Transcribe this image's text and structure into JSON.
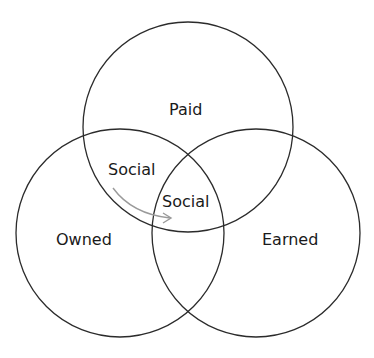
{
  "diagram": {
    "type": "venn",
    "circles": [
      {
        "id": "paid",
        "label": "Paid",
        "cx": 188,
        "cy": 127,
        "r": 105
      },
      {
        "id": "owned",
        "label": "Owned",
        "cx": 120,
        "cy": 233,
        "r": 104
      },
      {
        "id": "earned",
        "label": "Earned",
        "cx": 256,
        "cy": 233,
        "r": 104
      }
    ],
    "labels": {
      "paid": "Paid",
      "owned": "Owned",
      "earned": "Earned",
      "social_paid_owned": "Social",
      "social_center": "Social"
    },
    "arrow": {
      "from": "social_paid_owned",
      "to": "social_center",
      "color": "#9a9a9a"
    },
    "colors": {
      "stroke": "#2b2b2b",
      "text": "#1a1a1a",
      "background": "#ffffff"
    }
  }
}
